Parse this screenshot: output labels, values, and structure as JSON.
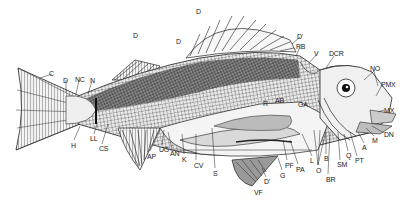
{
  "figure": {
    "labels": [
      {
        "id": "D1",
        "text": "D",
        "x": 196,
        "y": 8
      },
      {
        "id": "D2",
        "text": "D",
        "x": 133,
        "y": 32
      },
      {
        "id": "D3",
        "text": "D",
        "x": 176,
        "y": 38
      },
      {
        "id": "D4",
        "text": "D'",
        "x": 297,
        "y": 33
      },
      {
        "id": "RB",
        "text": "RB",
        "x": 296,
        "y": 43
      },
      {
        "id": "V",
        "text": "V",
        "x": 314,
        "y": 50
      },
      {
        "id": "DCR",
        "text": "DCR",
        "x": 329,
        "y": 50
      },
      {
        "id": "NO",
        "text": "NO",
        "x": 370,
        "y": 65
      },
      {
        "id": "PMX",
        "text": "PMX",
        "x": 381,
        "y": 81
      },
      {
        "id": "MX",
        "text": "MX",
        "x": 384,
        "y": 107
      },
      {
        "id": "DN",
        "text": "DN",
        "x": 384,
        "y": 131
      },
      {
        "id": "C",
        "text": "C",
        "x": 49,
        "y": 70
      },
      {
        "id": "D5",
        "text": "D",
        "x": 63,
        "y": 77
      },
      {
        "id": "NC",
        "text": "NC",
        "x": 75,
        "y": 76
      },
      {
        "id": "N",
        "text": "N",
        "x": 90,
        "y": 77
      },
      {
        "id": "AB",
        "text": "AB",
        "x": 275,
        "y": 97
      },
      {
        "id": "R",
        "text": "R",
        "x": 263,
        "y": 100
      },
      {
        "id": "GA",
        "text": "GA",
        "x": 298,
        "y": 101
      },
      {
        "id": "H",
        "text": "H",
        "x": 71,
        "y": 142
      },
      {
        "id": "LL",
        "text": "LL",
        "x": 90,
        "y": 135
      },
      {
        "id": "CS",
        "text": "CS",
        "x": 99,
        "y": 145
      },
      {
        "id": "AP",
        "text": "AP",
        "x": 147,
        "y": 153
      },
      {
        "id": "UG",
        "text": "UG",
        "x": 159,
        "y": 146
      },
      {
        "id": "AN",
        "text": "AN",
        "x": 170,
        "y": 150
      },
      {
        "id": "K",
        "text": "K",
        "x": 182,
        "y": 156
      },
      {
        "id": "CV",
        "text": "CV",
        "x": 194,
        "y": 162
      },
      {
        "id": "S",
        "text": "S",
        "x": 213,
        "y": 170
      },
      {
        "id": "PF",
        "text": "PF",
        "x": 285,
        "y": 162
      },
      {
        "id": "PA",
        "text": "PA",
        "x": 296,
        "y": 166
      },
      {
        "id": "L",
        "text": "L",
        "x": 310,
        "y": 157
      },
      {
        "id": "O",
        "text": "O",
        "x": 316,
        "y": 167
      },
      {
        "id": "B",
        "text": "B",
        "x": 324,
        "y": 155
      },
      {
        "id": "BR",
        "text": "BR",
        "x": 326,
        "y": 176
      },
      {
        "id": "SM",
        "text": "SM",
        "x": 337,
        "y": 161
      },
      {
        "id": "Q",
        "text": "Q",
        "x": 346,
        "y": 152
      },
      {
        "id": "PT",
        "text": "PT",
        "x": 355,
        "y": 157
      },
      {
        "id": "A",
        "text": "A",
        "x": 362,
        "y": 144
      },
      {
        "id": "M",
        "text": "M",
        "x": 372,
        "y": 137
      },
      {
        "id": "G",
        "text": "G",
        "x": 280,
        "y": 172
      },
      {
        "id": "D6",
        "text": "D'",
        "x": 264,
        "y": 178
      },
      {
        "id": "VF",
        "text": "VF",
        "x": 254,
        "y": 189
      }
    ]
  }
}
